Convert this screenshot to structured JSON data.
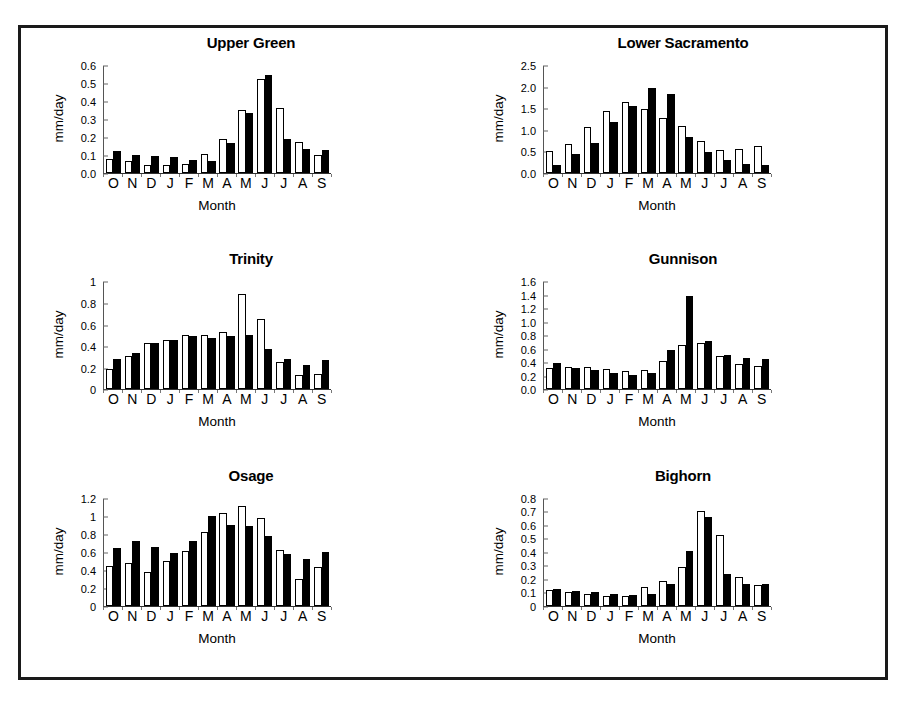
{
  "figure": {
    "background_color": "#ffffff",
    "frame_color": "#1a1a1a",
    "bar_open_color": "#ffffff",
    "bar_filled_color": "#000000",
    "axis_label_y": "mm/day",
    "axis_label_x": "Month",
    "categories": [
      "O",
      "N",
      "D",
      "J",
      "F",
      "M",
      "A",
      "M",
      "J",
      "J",
      "A",
      "S"
    ]
  },
  "chart_data": [
    {
      "type": "bar",
      "title": "Upper Green",
      "xlabel": "Month",
      "ylabel": "mm/day",
      "categories": [
        "O",
        "N",
        "D",
        "J",
        "F",
        "M",
        "A",
        "M",
        "J",
        "J",
        "A",
        "S"
      ],
      "ylim": [
        0.0,
        0.6
      ],
      "yticks": [
        "0.0",
        "0.1",
        "0.2",
        "0.3",
        "0.4",
        "0.5",
        "0.6"
      ],
      "ytick_values": [
        0.0,
        0.1,
        0.2,
        0.3,
        0.4,
        0.5,
        0.6
      ],
      "grid": false,
      "legend": "none",
      "series": [
        {
          "name": "open",
          "values": [
            0.08,
            0.065,
            0.045,
            0.045,
            0.048,
            0.108,
            0.19,
            0.35,
            0.525,
            0.36,
            0.17,
            0.1
          ]
        },
        {
          "name": "filled",
          "values": [
            0.12,
            0.1,
            0.095,
            0.088,
            0.075,
            0.065,
            0.165,
            0.335,
            0.545,
            0.19,
            0.135,
            0.13
          ]
        }
      ]
    },
    {
      "type": "bar",
      "title": "Lower Sacramento",
      "xlabel": "Month",
      "ylabel": "mm/day",
      "categories": [
        "O",
        "N",
        "D",
        "J",
        "F",
        "M",
        "A",
        "M",
        "J",
        "J",
        "A",
        "S"
      ],
      "ylim": [
        0.0,
        2.5
      ],
      "yticks": [
        "0.0",
        "0.5",
        "1.0",
        "1.5",
        "2.0",
        "2.5"
      ],
      "ytick_values": [
        0.0,
        0.5,
        1.0,
        1.5,
        2.0,
        2.5
      ],
      "grid": false,
      "legend": "none",
      "series": [
        {
          "name": "open",
          "values": [
            0.51,
            0.67,
            1.06,
            1.44,
            1.65,
            1.49,
            1.28,
            1.08,
            0.74,
            0.54,
            0.56,
            0.62
          ]
        },
        {
          "name": "filled",
          "values": [
            0.19,
            0.44,
            0.69,
            1.17,
            1.54,
            1.97,
            1.82,
            0.84,
            0.48,
            0.29,
            0.22,
            0.18
          ]
        }
      ]
    },
    {
      "type": "bar",
      "title": "Trinity",
      "xlabel": "Month",
      "ylabel": "mm/day",
      "categories": [
        "O",
        "N",
        "D",
        "J",
        "F",
        "M",
        "A",
        "M",
        "J",
        "J",
        "A",
        "S"
      ],
      "ylim": [
        0,
        1
      ],
      "yticks": [
        "0",
        "0.2",
        "0.4",
        "0.6",
        "0.8",
        "1"
      ],
      "ytick_values": [
        0,
        0.2,
        0.4,
        0.6,
        0.8,
        1
      ],
      "grid": false,
      "legend": "none",
      "series": [
        {
          "name": "open",
          "values": [
            0.185,
            0.305,
            0.43,
            0.455,
            0.5,
            0.5,
            0.535,
            0.885,
            0.65,
            0.255,
            0.135,
            0.145
          ]
        },
        {
          "name": "filled",
          "values": [
            0.285,
            0.34,
            0.425,
            0.455,
            0.495,
            0.475,
            0.49,
            0.505,
            0.375,
            0.285,
            0.23,
            0.27
          ]
        }
      ]
    },
    {
      "type": "bar",
      "title": "Gunnison",
      "xlabel": "Month",
      "ylabel": "mm/day",
      "categories": [
        "O",
        "N",
        "D",
        "J",
        "F",
        "M",
        "A",
        "M",
        "J",
        "J",
        "A",
        "S"
      ],
      "ylim": [
        0.0,
        1.6
      ],
      "yticks": [
        "0.0",
        "0.2",
        "0.4",
        "0.6",
        "0.8",
        "1.0",
        "1.2",
        "1.4",
        "1.6"
      ],
      "ytick_values": [
        0.0,
        0.2,
        0.4,
        0.6,
        0.8,
        1.0,
        1.2,
        1.4,
        1.6
      ],
      "grid": false,
      "legend": "none",
      "series": [
        {
          "name": "open",
          "values": [
            0.32,
            0.325,
            0.325,
            0.295,
            0.265,
            0.285,
            0.425,
            0.65,
            0.68,
            0.49,
            0.38,
            0.34
          ]
        },
        {
          "name": "filled",
          "values": [
            0.395,
            0.32,
            0.28,
            0.245,
            0.21,
            0.245,
            0.59,
            1.385,
            0.72,
            0.515,
            0.47,
            0.445
          ]
        }
      ]
    },
    {
      "type": "bar",
      "title": "Osage",
      "xlabel": "Month",
      "ylabel": "mm/day",
      "categories": [
        "O",
        "N",
        "D",
        "J",
        "F",
        "M",
        "A",
        "M",
        "J",
        "J",
        "A",
        "S"
      ],
      "ylim": [
        0,
        1.2
      ],
      "yticks": [
        "0",
        "0.2",
        "0.4",
        "0.6",
        "0.8",
        "1",
        "1.2"
      ],
      "ytick_values": [
        0,
        0.2,
        0.4,
        0.6,
        0.8,
        1,
        1.2
      ],
      "grid": false,
      "legend": "none",
      "series": [
        {
          "name": "open",
          "values": [
            0.44,
            0.47,
            0.375,
            0.495,
            0.61,
            0.815,
            1.03,
            1.11,
            0.975,
            0.615,
            0.3,
            0.435
          ]
        },
        {
          "name": "filled",
          "values": [
            0.645,
            0.715,
            0.65,
            0.58,
            0.715,
            1.0,
            0.895,
            0.88,
            0.775,
            0.575,
            0.515,
            0.595
          ]
        }
      ]
    },
    {
      "type": "bar",
      "title": "Bighorn",
      "xlabel": "Month",
      "ylabel": "mm/day",
      "categories": [
        "O",
        "N",
        "D",
        "J",
        "F",
        "M",
        "A",
        "M",
        "J",
        "J",
        "A",
        "S"
      ],
      "ylim": [
        0,
        0.8
      ],
      "yticks": [
        "0",
        "0.1",
        "0.2",
        "0.3",
        "0.4",
        "0.5",
        "0.6",
        "0.7",
        "0.8"
      ],
      "ytick_values": [
        0,
        0.1,
        0.2,
        0.3,
        0.4,
        0.5,
        0.6,
        0.7,
        0.8
      ],
      "grid": false,
      "legend": "none",
      "series": [
        {
          "name": "open",
          "values": [
            0.115,
            0.1,
            0.09,
            0.075,
            0.07,
            0.14,
            0.18,
            0.285,
            0.7,
            0.52,
            0.215,
            0.155
          ]
        },
        {
          "name": "filled",
          "values": [
            0.125,
            0.105,
            0.1,
            0.085,
            0.08,
            0.085,
            0.16,
            0.405,
            0.655,
            0.235,
            0.16,
            0.16
          ]
        }
      ]
    }
  ]
}
